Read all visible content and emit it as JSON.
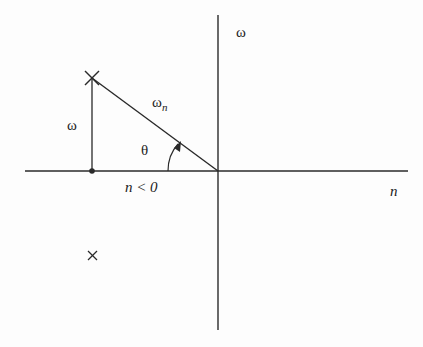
{
  "diagram": {
    "axis_vertical_label": "ω",
    "axis_horizontal_label": "n",
    "vertical_segment_label": "ω",
    "hypotenuse_label_base": "ω",
    "hypotenuse_label_sub": "n",
    "angle_label": "θ",
    "region_label": "n < 0",
    "pole_upper": "×",
    "pole_lower": "×",
    "colors": {
      "line": "#2a2a2a",
      "background": "#fdfdfd"
    }
  }
}
